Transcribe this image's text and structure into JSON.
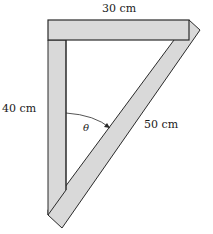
{
  "diagram": {
    "labels": {
      "top": "30 cm",
      "left": "40 cm",
      "hypotenuse": "50 cm",
      "angle": "θ"
    },
    "colors": {
      "bar_fill": "#d9d9d9",
      "bar_stroke": "#2a2a2a",
      "background": "#ffffff"
    },
    "geometry": {
      "top_bar": {
        "x1": 48,
        "y1": 20,
        "x2": 189,
        "y2": 40
      },
      "vertical_bar": {
        "x1": 48,
        "y1": 40,
        "x2": 66,
        "y2": 215
      },
      "diagonal_bar_tips": {
        "top": [
          200,
          30
        ],
        "bottom": [
          62,
          228
        ]
      }
    }
  }
}
